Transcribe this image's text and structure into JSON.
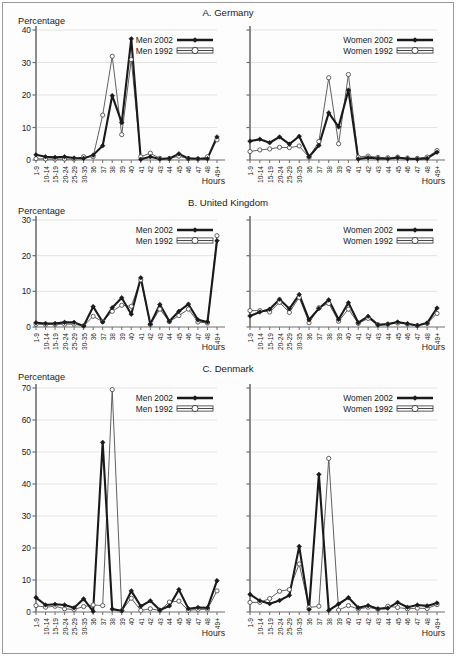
{
  "figure": {
    "y_axis_caption": "Percentage",
    "x_axis_caption": "Hours",
    "categories": [
      "1-9",
      "10-14",
      "15-19",
      "20-24",
      "25-29",
      "30-35",
      "36",
      "37",
      "38",
      "39",
      "40",
      "41",
      "42",
      "43",
      "44",
      "45",
      "46",
      "47",
      "48",
      "49+"
    ],
    "series_colors": {
      "line_2002": "#1a1a1a",
      "line_1992": "#4f4f4f",
      "grid": "#d8d8d8",
      "axis": "#6f6f6f"
    }
  },
  "chart_data": [
    {
      "id": "germany-men",
      "type": "line",
      "title": "A. Germany",
      "panel": "men",
      "xlabel": "Hours",
      "ylabel": "Percentage",
      "ylim": [
        0,
        40
      ],
      "yticks": [
        0,
        10,
        20,
        30,
        40
      ],
      "grid": true,
      "legend_position": "top-right",
      "categories": [
        "1-9",
        "10-14",
        "15-19",
        "20-24",
        "25-29",
        "30-35",
        "36",
        "37",
        "38",
        "39",
        "40",
        "41",
        "42",
        "43",
        "44",
        "45",
        "46",
        "47",
        "48",
        "49+"
      ],
      "series": [
        {
          "name": "Men 2002",
          "marker": "filled-diamond",
          "values": [
            1.6,
            1.0,
            0.8,
            1.0,
            0.6,
            0.5,
            1.5,
            4.4,
            19.8,
            11.5,
            37.3,
            0.2,
            1.0,
            0.3,
            0.5,
            1.9,
            0.5,
            0.4,
            0.4,
            7.1
          ]
        },
        {
          "name": "Men 1992",
          "marker": "open-circle",
          "values": [
            0.4,
            0.3,
            0.3,
            0.3,
            0.3,
            1.0,
            1.0,
            13.8,
            31.9,
            7.8,
            30.9,
            1.0,
            2.1,
            0.5,
            0.4,
            1.2,
            0.4,
            0.3,
            1.0,
            6.2
          ]
        }
      ]
    },
    {
      "id": "germany-women",
      "type": "line",
      "title": "A. Germany",
      "panel": "women",
      "xlabel": "Hours",
      "ylabel": "Percentage",
      "ylim": [
        0,
        40
      ],
      "yticks": [
        0,
        10,
        20,
        30,
        40
      ],
      "grid": true,
      "legend_position": "top-right",
      "categories": [
        "1-9",
        "10-14",
        "15-19",
        "20-24",
        "25-29",
        "30-35",
        "36",
        "37",
        "38",
        "39",
        "40",
        "41",
        "42",
        "43",
        "44",
        "45",
        "46",
        "47",
        "48",
        "49+"
      ],
      "series": [
        {
          "name": "Women 2002",
          "marker": "filled-diamond",
          "values": [
            5.8,
            6.4,
            5.3,
            7.1,
            4.9,
            7.3,
            1.0,
            4.5,
            14.5,
            10.2,
            21.5,
            0.3,
            0.7,
            0.5,
            0.4,
            0.7,
            0.4,
            0.3,
            0.5,
            2.4
          ]
        },
        {
          "name": "Women 1992",
          "marker": "open-circle",
          "values": [
            2.6,
            3.1,
            3.4,
            3.9,
            3.8,
            4.3,
            0.8,
            5.7,
            25.3,
            5.0,
            26.3,
            0.9,
            1.2,
            0.8,
            0.7,
            0.9,
            0.6,
            0.5,
            0.9,
            2.9
          ]
        }
      ]
    },
    {
      "id": "uk-men",
      "type": "line",
      "title": "B. United Kingdom",
      "panel": "men",
      "xlabel": "Hours",
      "ylabel": "Percentage",
      "ylim": [
        0,
        30
      ],
      "yticks": [
        0,
        10,
        20,
        30
      ],
      "grid": true,
      "legend_position": "top-right",
      "categories": [
        "1-9",
        "10-14",
        "15-19",
        "20-24",
        "25-29",
        "30-35",
        "36",
        "37",
        "38",
        "39",
        "40",
        "41",
        "42",
        "43",
        "44",
        "45",
        "46",
        "47",
        "48",
        "49+"
      ],
      "series": [
        {
          "name": "Men 2002",
          "marker": "filled-diamond",
          "values": [
            1.2,
            1.0,
            1.0,
            1.3,
            1.3,
            0.3,
            5.7,
            1.4,
            5.4,
            8.2,
            3.6,
            13.8,
            0.8,
            6.3,
            1.6,
            4.4,
            6.4,
            2.0,
            1.4,
            24.2
          ]
        },
        {
          "name": "Men 1992",
          "marker": "open-circle",
          "values": [
            0.8,
            0.7,
            0.7,
            0.8,
            0.8,
            0.3,
            3.0,
            1.5,
            4.4,
            6.1,
            5.8,
            13.2,
            0.7,
            5.0,
            1.5,
            3.2,
            5.0,
            1.4,
            1.1,
            25.6
          ]
        }
      ]
    },
    {
      "id": "uk-women",
      "type": "line",
      "title": "B. United Kingdom",
      "panel": "women",
      "xlabel": "Hours",
      "ylabel": "Percentage",
      "ylim": [
        0,
        30
      ],
      "yticks": [
        0,
        10,
        20,
        30
      ],
      "grid": true,
      "legend_position": "top-right",
      "categories": [
        "1-9",
        "10-14",
        "15-19",
        "20-24",
        "25-29",
        "30-35",
        "36",
        "37",
        "38",
        "39",
        "40",
        "41",
        "42",
        "43",
        "44",
        "45",
        "46",
        "47",
        "48",
        "49+"
      ],
      "series": [
        {
          "name": "Women 2002",
          "marker": "filled-diamond",
          "values": [
            3.1,
            4.2,
            5.0,
            7.8,
            5.1,
            9.1,
            2.0,
            5.2,
            7.6,
            2.1,
            6.8,
            1.2,
            3.0,
            0.6,
            0.8,
            1.4,
            0.9,
            0.4,
            1.1,
            5.3
          ]
        },
        {
          "name": "Women 1992",
          "marker": "open-circle",
          "values": [
            4.6,
            4.6,
            4.2,
            6.9,
            4.1,
            8.3,
            1.2,
            5.4,
            6.6,
            1.6,
            5.0,
            1.0,
            2.4,
            0.6,
            0.8,
            1.1,
            0.8,
            0.4,
            1.0,
            3.8
          ]
        }
      ]
    },
    {
      "id": "denmark-men",
      "type": "line",
      "title": "C. Denmark",
      "panel": "men",
      "xlabel": "Hours",
      "ylabel": "Percentage",
      "ylim": [
        0,
        70
      ],
      "yticks": [
        0,
        10,
        20,
        30,
        40,
        50,
        60,
        70
      ],
      "grid": true,
      "legend_position": "top-right",
      "categories": [
        "1-9",
        "10-14",
        "15-19",
        "20-24",
        "25-29",
        "30-35",
        "36",
        "37",
        "38",
        "39",
        "40",
        "41",
        "42",
        "43",
        "44",
        "45",
        "46",
        "47",
        "48",
        "49+"
      ],
      "series": [
        {
          "name": "Men 2002",
          "marker": "filled-diamond",
          "values": [
            4.5,
            2.2,
            2.4,
            2.2,
            1.3,
            4.1,
            0.2,
            53.0,
            0.9,
            0.4,
            6.6,
            1.8,
            3.5,
            0.6,
            1.9,
            7.0,
            1.0,
            1.4,
            1.3,
            9.8
          ]
        },
        {
          "name": "Men 1992",
          "marker": "open-circle",
          "values": [
            2.0,
            1.5,
            1.8,
            1.0,
            0.8,
            1.7,
            2.2,
            2.0,
            69.5,
            0.4,
            4.3,
            0.5,
            1.0,
            0.5,
            3.1,
            3.4,
            0.5,
            0.8,
            0.9,
            6.6
          ]
        }
      ]
    },
    {
      "id": "denmark-women",
      "type": "line",
      "title": "C. Denmark",
      "panel": "women",
      "xlabel": "Hours",
      "ylabel": "Percentage",
      "ylim": [
        0,
        70
      ],
      "yticks": [
        0,
        10,
        20,
        30,
        40,
        50,
        60,
        70
      ],
      "grid": true,
      "legend_position": "top-right",
      "categories": [
        "1-9",
        "10-14",
        "15-19",
        "20-24",
        "25-29",
        "30-35",
        "36",
        "37",
        "38",
        "39",
        "40",
        "41",
        "42",
        "43",
        "44",
        "45",
        "46",
        "47",
        "48",
        "49+"
      ],
      "series": [
        {
          "name": "Women 2002",
          "marker": "filled-diamond",
          "values": [
            5.5,
            3.5,
            2.6,
            3.6,
            5.2,
            20.5,
            0.8,
            43.0,
            0.5,
            2.5,
            4.5,
            1.3,
            2.0,
            1.0,
            1.2,
            3.0,
            1.5,
            2.2,
            1.9,
            2.8
          ]
        },
        {
          "name": "Women 1992",
          "marker": "open-circle",
          "values": [
            3.0,
            3.0,
            4.2,
            6.5,
            7.0,
            15.0,
            1.4,
            1.8,
            48.0,
            0.6,
            2.0,
            0.9,
            1.5,
            0.8,
            1.8,
            1.4,
            1.0,
            1.2,
            1.1,
            2.3
          ]
        }
      ]
    }
  ],
  "panels": [
    {
      "title": "A. Germany",
      "ylabel": "Percentage",
      "xlabel": "Hours",
      "legend_men": [
        "Men 2002",
        "Men 1992"
      ],
      "legend_women": [
        "Women 2002",
        "Women 1992"
      ]
    },
    {
      "title": "B. United Kingdom",
      "ylabel": "Percentage",
      "xlabel": "Hours",
      "legend_men": [
        "Men 2002",
        "Men 1992"
      ],
      "legend_women": [
        "Women 2002",
        "Women 1992"
      ]
    },
    {
      "title": "C. Denmark",
      "ylabel": "Percentage",
      "xlabel": "Hours",
      "legend_men": [
        "Men 2002",
        "Men 1992"
      ],
      "legend_women": [
        "Women 2002",
        "Women 1992"
      ]
    }
  ]
}
